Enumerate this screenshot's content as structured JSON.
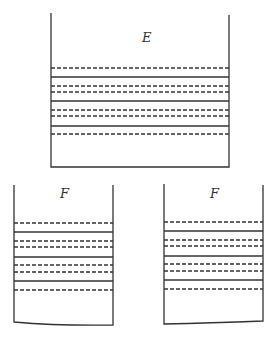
{
  "diagram": {
    "containers": [
      {
        "id": "E",
        "label": "E",
        "x1": 51,
        "x2": 229,
        "top": 13,
        "bottom": 167,
        "lines": [
          {
            "y": 68,
            "style": "dashed"
          },
          {
            "y": 77,
            "style": "solid"
          },
          {
            "y": 86,
            "style": "dashed"
          },
          {
            "y": 92,
            "style": "dashed"
          },
          {
            "y": 101,
            "style": "solid"
          },
          {
            "y": 110,
            "style": "dashed"
          },
          {
            "y": 116,
            "style": "dashed"
          },
          {
            "y": 126,
            "style": "solid"
          },
          {
            "y": 134,
            "style": "dashed"
          }
        ]
      },
      {
        "id": "F-left",
        "label": "F",
        "x1": 14,
        "x2": 113,
        "top": 185,
        "bottom": 322,
        "lines": [
          {
            "y": 223,
            "style": "dashed"
          },
          {
            "y": 232,
            "style": "solid"
          },
          {
            "y": 241,
            "style": "dashed"
          },
          {
            "y": 247,
            "style": "dashed"
          },
          {
            "y": 257,
            "style": "solid"
          },
          {
            "y": 265,
            "style": "dashed"
          },
          {
            "y": 272,
            "style": "dashed"
          },
          {
            "y": 281,
            "style": "solid"
          },
          {
            "y": 290,
            "style": "dashed"
          }
        ]
      },
      {
        "id": "F-right",
        "label": "F",
        "x1": 164,
        "x2": 263,
        "top": 185,
        "bottom": 322,
        "lines": [
          {
            "y": 222,
            "style": "dashed"
          },
          {
            "y": 231,
            "style": "solid"
          },
          {
            "y": 240,
            "style": "dashed"
          },
          {
            "y": 246,
            "style": "dashed"
          },
          {
            "y": 256,
            "style": "solid"
          },
          {
            "y": 264,
            "style": "dashed"
          },
          {
            "y": 271,
            "style": "dashed"
          },
          {
            "y": 280,
            "style": "solid"
          },
          {
            "y": 289,
            "style": "dashed"
          }
        ]
      }
    ]
  }
}
